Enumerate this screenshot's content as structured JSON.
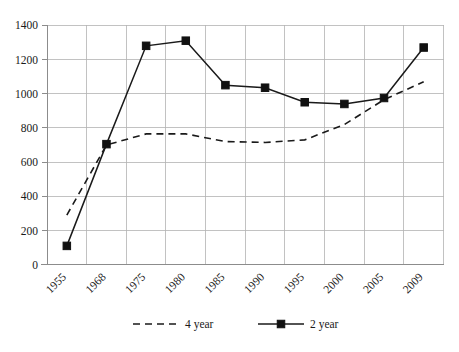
{
  "chart_data": {
    "type": "line",
    "title": "",
    "subtitle": "",
    "xlabel": "",
    "ylabel": "",
    "categories": [
      "1955",
      "1968",
      "1975",
      "1980",
      "1985",
      "1990",
      "1995",
      "2000",
      "2005",
      "2009"
    ],
    "series": [
      {
        "name": "4 year",
        "style": "dashed",
        "marker": "none",
        "color": "#1a1a1a",
        "values": [
          290,
          700,
          765,
          765,
          720,
          715,
          730,
          820,
          965,
          1070
        ]
      },
      {
        "name": "2 year",
        "style": "solid",
        "marker": "square",
        "color": "#1a1a1a",
        "values": [
          110,
          705,
          1280,
          1310,
          1050,
          1035,
          950,
          940,
          975,
          1270
        ]
      }
    ],
    "ylim": [
      0,
      1400
    ],
    "ytick_labels": [
      "0",
      "200",
      "400",
      "600",
      "800",
      "1000",
      "1200",
      "1400"
    ],
    "ytick_values": [
      0,
      200,
      400,
      600,
      800,
      1000,
      1200,
      1400
    ],
    "grid": "both",
    "legend_position": "bottom",
    "legend": [
      {
        "label": "4 year",
        "style": "dashed",
        "marker": "none"
      },
      {
        "label": "2 year",
        "style": "solid",
        "marker": "square"
      }
    ],
    "colors": {
      "series": "#1a1a1a",
      "grid": "#b3b3b3",
      "axis": "#8c8c8c",
      "background": "#ffffff"
    }
  }
}
